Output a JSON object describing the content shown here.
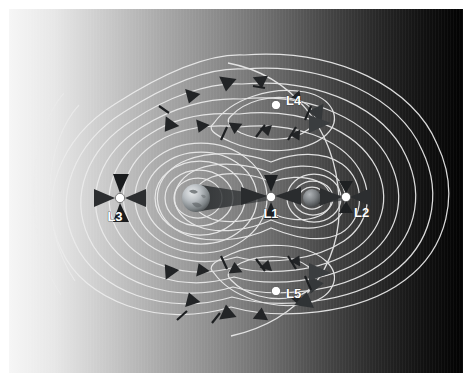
{
  "figure": {
    "background": {
      "gradient_from": "#f4f4f4",
      "gradient_to": "#030303",
      "direction": "left-to-right",
      "plate_border_color": "#ffffff"
    },
    "colors": {
      "contour_line": "#e8e8e8",
      "contour_line_dim": "#c9c9c9",
      "marker_dot": "#ffffff",
      "marker_dot_stroke": "#3a3a3a",
      "arrow_dark": "#232323",
      "arrow_mid": "#3c3c3c",
      "label_text": "#ffffff",
      "label_outline": "#2a2a2a",
      "primary_body": "#9fa4a8",
      "secondary_body": "#6e7174"
    }
  },
  "bodies": [
    {
      "name": "primary-body",
      "label": "",
      "cx": 187,
      "cy": 189,
      "r": 14,
      "shadow_cone": true
    },
    {
      "name": "secondary-body",
      "label": "",
      "cx": 303,
      "cy": 189,
      "r": 9,
      "shadow_cone": true
    }
  ],
  "lagrange_points": [
    {
      "id": "L1",
      "label": "L1",
      "x": 262,
      "y": 188,
      "label_x": 262,
      "label_y": 208,
      "label_anchor": "middle",
      "arrow_pattern": "converging-vertical-horizontal",
      "description": "Between the two bodies"
    },
    {
      "id": "L2",
      "label": "L2",
      "x": 337,
      "y": 188,
      "label_x": 345,
      "label_y": 207,
      "label_anchor": "start",
      "arrow_pattern": "converging-horizontal",
      "description": "Beyond the secondary body"
    },
    {
      "id": "L3",
      "label": "L3",
      "x": 111,
      "y": 189,
      "label_x": 106,
      "label_y": 211,
      "label_anchor": "middle",
      "arrow_pattern": "converging-four-way",
      "description": "Opposite the secondary body"
    },
    {
      "id": "L4",
      "label": "L4",
      "x": 267,
      "y": 95,
      "label_x": 278,
      "label_y": 95,
      "label_anchor": "start",
      "arrow_pattern": "orbiting-counterclockwise",
      "description": "Leading triangular point"
    },
    {
      "id": "L5",
      "label": "L5",
      "x": 267,
      "y": 282,
      "label_x": 278,
      "label_y": 288,
      "label_anchor": "start",
      "arrow_pattern": "orbiting-clockwise",
      "description": "Trailing triangular point"
    }
  ],
  "contours": {
    "style": "equipotential",
    "line_count": 22,
    "note": "Nested closed curves around each body, merging into peanut-shaped curves through L1, then outer curves enclosing both bodies through L2 and L3; lobes around L4 and L5."
  },
  "flow_arrows": {
    "count": 34,
    "glyph": "triangle",
    "note": "Dark triangular direction markers distributed along the contour lines indicating the sense of the gravitational gradient / orbital flow."
  }
}
